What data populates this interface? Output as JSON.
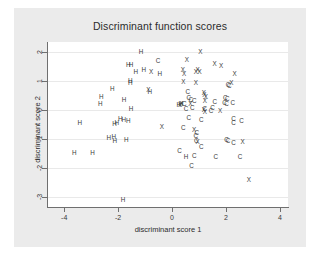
{
  "chart_data": {
    "type": "scatter",
    "title": "Discriminant function scores",
    "xlabel": "discriminant score 1",
    "ylabel": "discriminant score 2",
    "xlim": [
      -4.6,
      4.3
    ],
    "ylim": [
      -3.35,
      2.35
    ],
    "xticks": [
      -4,
      -2,
      0,
      2,
      4
    ],
    "xtick_labels": [
      "-4",
      "-2",
      "0",
      "2",
      "4"
    ],
    "yticks": [
      -3,
      -2,
      -1,
      0,
      1,
      2
    ],
    "ytick_labels": [
      "-3",
      "-2",
      "-1",
      "0",
      "1",
      "2"
    ],
    "grid": "horizontal",
    "legend": "none",
    "marker_labels": [
      "H",
      "C",
      "X"
    ],
    "series": [
      {
        "name": "H",
        "label": "H",
        "points": [
          [
            -1.15,
            2.02
          ],
          [
            -1.62,
            1.55
          ],
          [
            -1.52,
            1.55
          ],
          [
            -1.34,
            1.33
          ],
          [
            -1.05,
            1.37
          ],
          [
            -1.55,
            1.02
          ],
          [
            -1.55,
            0.95
          ],
          [
            -0.82,
            0.62
          ],
          [
            -2.22,
            0.72
          ],
          [
            -2.62,
            0.45
          ],
          [
            -2.66,
            0.22
          ],
          [
            -1.78,
            0.36
          ],
          [
            -1.52,
            0.02
          ],
          [
            0.32,
            0.2
          ],
          [
            0.25,
            0.18
          ],
          [
            -1.92,
            -0.32
          ],
          [
            -1.79,
            -0.36
          ],
          [
            -2.05,
            -0.44
          ],
          [
            -2.13,
            -0.48
          ],
          [
            -1.62,
            -0.37
          ],
          [
            -3.42,
            -0.44
          ],
          [
            -2.35,
            -0.95
          ],
          [
            -2.16,
            -0.92
          ],
          [
            -2.12,
            -1.08
          ],
          [
            -1.7,
            -1.05
          ],
          [
            -3.62,
            -1.5
          ],
          [
            -2.95,
            -1.5
          ],
          [
            0.52,
            -1.62
          ],
          [
            -1.82,
            -3.1
          ],
          [
            -0.45,
            1.25
          ]
        ]
      },
      {
        "name": "C",
        "label": "C",
        "points": [
          [
            -0.52,
            1.68
          ],
          [
            0.62,
            0.42
          ],
          [
            0.7,
            0.36
          ],
          [
            0.82,
            0.32
          ],
          [
            0.46,
            0.2
          ],
          [
            0.75,
            0.08
          ],
          [
            0.52,
            0.02
          ],
          [
            1.22,
            0.05
          ],
          [
            1.45,
            -0.02
          ],
          [
            1.58,
            0.28
          ],
          [
            1.95,
            0.25
          ],
          [
            2.02,
            0.22
          ],
          [
            2.25,
            0.25
          ],
          [
            2.08,
            0.88
          ],
          [
            2.12,
            0.82
          ],
          [
            1.98,
            0.4
          ],
          [
            2.05,
            0.38
          ],
          [
            0.62,
            -0.28
          ],
          [
            0.42,
            -0.62
          ],
          [
            1.08,
            -0.35
          ],
          [
            2.28,
            -0.32
          ],
          [
            2.28,
            -0.45
          ],
          [
            2.58,
            -0.38
          ],
          [
            0.92,
            -0.78
          ],
          [
            0.88,
            -0.88
          ],
          [
            0.9,
            -1.08
          ],
          [
            1.08,
            -1.28
          ],
          [
            0.28,
            -1.42
          ],
          [
            2.02,
            -1.02
          ],
          [
            2.08,
            -1.08
          ],
          [
            2.28,
            -1.15
          ],
          [
            0.82,
            -1.6
          ],
          [
            1.62,
            -1.62
          ],
          [
            2.52,
            -1.62
          ],
          [
            0.72,
            -1.92
          ],
          [
            1.5,
            0.08
          ],
          [
            0.58,
            0.62
          ]
        ]
      },
      {
        "name": "X",
        "label": "X",
        "points": [
          [
            1.05,
            2.02
          ],
          [
            0.55,
            1.72
          ],
          [
            1.58,
            1.58
          ],
          [
            1.82,
            1.52
          ],
          [
            0.4,
            1.38
          ],
          [
            0.95,
            1.38
          ],
          [
            1.02,
            1.32
          ],
          [
            -0.78,
            1.32
          ],
          [
            0.45,
            1.25
          ],
          [
            2.32,
            1.25
          ],
          [
            0.42,
            0.98
          ],
          [
            0.88,
            0.95
          ],
          [
            -0.88,
            0.68
          ],
          [
            1.18,
            0.6
          ],
          [
            2.2,
            0.92
          ],
          [
            1.2,
            0.52
          ],
          [
            1.25,
            0.45
          ],
          [
            1.22,
            0.32
          ],
          [
            0.68,
            0.22
          ],
          [
            0.35,
            0.2
          ],
          [
            1.18,
            0.0
          ],
          [
            1.22,
            -0.05
          ],
          [
            1.78,
            -0.02
          ],
          [
            -0.38,
            -0.6
          ],
          [
            0.82,
            -0.68
          ],
          [
            0.95,
            -1.12
          ],
          [
            2.62,
            -1.12
          ],
          [
            2.85,
            -2.42
          ],
          [
            0.88,
            1.32
          ],
          [
            0.3,
            0.18
          ]
        ]
      }
    ]
  },
  "colors": {
    "figure_background": "#ebebeb",
    "plot_background": "#ffffff",
    "axis": "#6f6f6f",
    "gridline": "#e9e9e9",
    "text": "#2b2b2b",
    "marker": "#3a3a3a"
  }
}
